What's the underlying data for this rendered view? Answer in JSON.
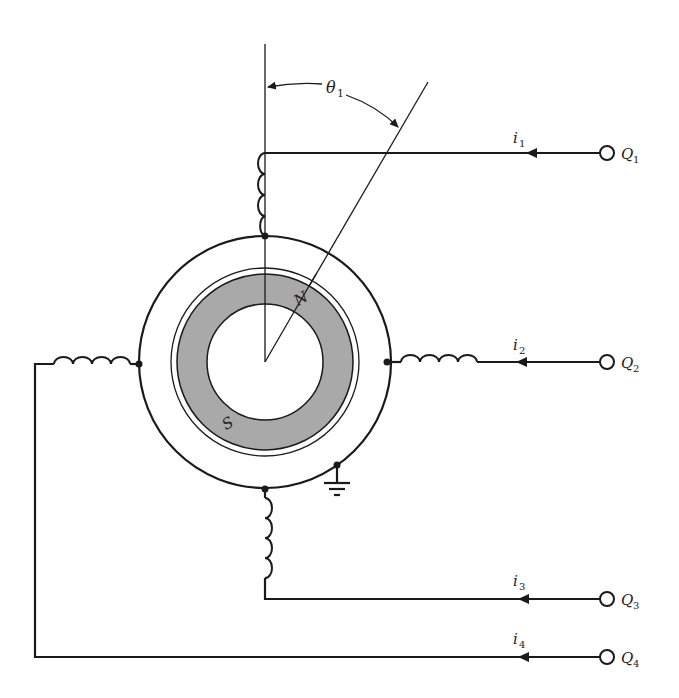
{
  "figure": {
    "angle_label": {
      "symbol": "θ",
      "subscript": "1"
    },
    "rotor": {
      "north_label": "N",
      "south_label": "S",
      "magnet_color": "#a9a9a9"
    },
    "terminals": [
      {
        "id": "Q1",
        "label": "Q",
        "subscript": "1",
        "current": "i",
        "current_sub": "1"
      },
      {
        "id": "Q2",
        "label": "Q",
        "subscript": "2",
        "current": "i",
        "current_sub": "2"
      },
      {
        "id": "Q3",
        "label": "Q",
        "subscript": "3",
        "current": "i",
        "current_sub": "3"
      },
      {
        "id": "Q4",
        "label": "Q",
        "subscript": "4",
        "current": "i",
        "current_sub": "4"
      }
    ],
    "ground": "ground-symbol"
  }
}
